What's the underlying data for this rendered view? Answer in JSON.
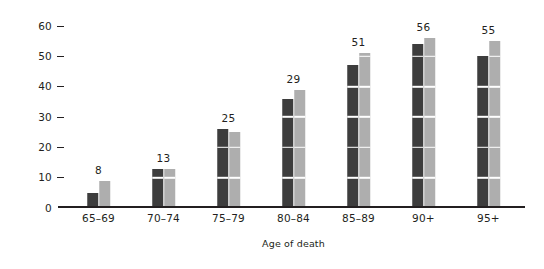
{
  "chart_data": {
    "type": "bar",
    "title": "",
    "subtitle": "",
    "xlabel": "Age of death",
    "ylabel": "Proportion in %",
    "categories": [
      "65–69",
      "70–74",
      "75–79",
      "80–84",
      "85–89",
      "90+",
      "95+"
    ],
    "series": [
      {
        "name": "series-1-dark",
        "color": "#3d3d3d",
        "values": [
          5,
          13,
          26,
          36,
          47,
          54,
          50
        ]
      },
      {
        "name": "series-2-light",
        "color": "#aeaeae",
        "values": [
          9,
          13,
          25,
          39,
          51,
          56,
          55
        ]
      }
    ],
    "data_labels": [
      "8",
      "13",
      "25",
      "29",
      "51",
      "56",
      "55"
    ],
    "ylim": [
      0,
      62
    ],
    "yticks": [
      0,
      10,
      20,
      30,
      40,
      50,
      60
    ],
    "ytick_labels": [
      "0",
      "10",
      "20",
      "30",
      "40",
      "50",
      "60"
    ],
    "gridlines": [
      10,
      20,
      30,
      40,
      50
    ],
    "grid": "white horizontal lines overlaid on bars",
    "legend": "none",
    "legend_position": "none",
    "background_color": "#ffffff",
    "axis_color": "#231f20"
  }
}
